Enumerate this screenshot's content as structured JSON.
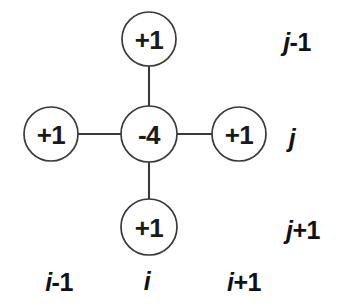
{
  "figure": {
    "type": "five-point-laplacian-stencil",
    "background_color": "#ffffff",
    "stroke_color": "#3a3a3a",
    "text_color": "#1a1a1a"
  },
  "nodes": {
    "top": {
      "value": "+1",
      "cx": 149,
      "cy": 39,
      "r": 27
    },
    "left": {
      "value": "+1",
      "cx": 51,
      "cy": 134,
      "r": 27
    },
    "center": {
      "value": "-4",
      "cx": 149,
      "cy": 134,
      "r": 28
    },
    "right": {
      "value": "+1",
      "cx": 239,
      "cy": 134,
      "r": 27
    },
    "bottom": {
      "value": "+1",
      "cx": 149,
      "cy": 227,
      "r": 28
    }
  },
  "connectors": [
    {
      "name": "center-to-top",
      "x1": 149,
      "y1": 66,
      "x2": 149,
      "y2": 107
    },
    {
      "name": "center-to-bottom",
      "x1": 149,
      "y1": 162,
      "x2": 149,
      "y2": 200
    },
    {
      "name": "center-to-left",
      "x1": 78,
      "y1": 134,
      "x2": 121,
      "y2": 134
    },
    {
      "name": "center-to-right",
      "x1": 177,
      "y1": 134,
      "x2": 212,
      "y2": 134
    }
  ],
  "row_labels": [
    {
      "name": "row-j-minus-1",
      "var": "j",
      "offset": "-1",
      "x": 297,
      "y": 42
    },
    {
      "name": "row-j",
      "var": "j",
      "offset": "",
      "x": 292,
      "y": 138
    },
    {
      "name": "row-j-plus-1",
      "var": "j",
      "offset": "+1",
      "x": 303,
      "y": 230
    }
  ],
  "column_labels": [
    {
      "name": "col-i-minus-1",
      "var": "i",
      "offset": "-1",
      "x": 59,
      "y": 282
    },
    {
      "name": "col-i",
      "var": "i",
      "offset": "",
      "x": 147,
      "y": 281
    },
    {
      "name": "col-i-plus-1",
      "var": "i",
      "offset": "+1",
      "x": 244,
      "y": 282
    }
  ]
}
